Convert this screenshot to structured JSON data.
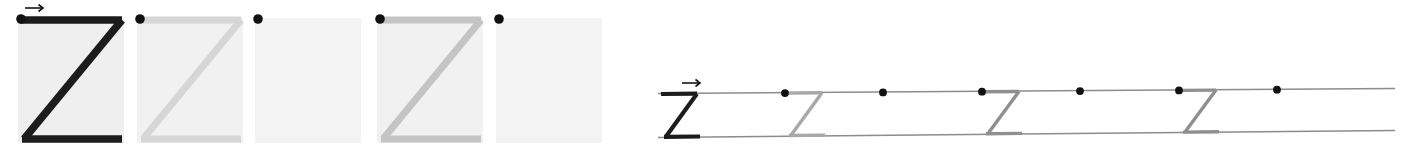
{
  "worksheet": {
    "letter": "Z",
    "title": "Letter Z handwriting practice worksheet",
    "direction_arrow": "→",
    "arrow_label": "stroke-direction-arrow",
    "colors": {
      "page_background": "#ffffff",
      "box_fill": "#efefef",
      "box_fill_light": "#f2f2f2",
      "stroke_dark": "#1c1c1c",
      "stroke_mid_gray": "#b9b9b9",
      "stroke_light_gray": "#d6d6d6",
      "start_dot": "#111111",
      "rule_line": "#8c8c8c"
    }
  },
  "practice_boxes": {
    "label": "Letter tracing boxes",
    "count": 5,
    "items": [
      {
        "index": 1,
        "name": "model-letter-box",
        "glyph": "Z",
        "stroke_shade": "dark",
        "stroke_color": "#1c1c1c",
        "has_letter": true,
        "has_start_dot": true,
        "has_direction_arrow": true,
        "caption": "Model letter shown in full black"
      },
      {
        "index": 2,
        "name": "trace-letter-box",
        "glyph": "Z",
        "stroke_shade": "light-gray",
        "stroke_color": "#d6d6d6",
        "has_letter": true,
        "has_start_dot": true,
        "has_direction_arrow": false,
        "caption": "Faint trace guide"
      },
      {
        "index": 3,
        "name": "blank-practice-box",
        "glyph": "",
        "stroke_shade": "none",
        "stroke_color": "",
        "has_letter": false,
        "has_start_dot": true,
        "has_direction_arrow": false,
        "caption": "Empty box with start dot only"
      },
      {
        "index": 4,
        "name": "trace-letter-box",
        "glyph": "Z",
        "stroke_shade": "mid-gray",
        "stroke_color": "#c4c4c4",
        "has_letter": true,
        "has_start_dot": true,
        "has_direction_arrow": false,
        "caption": "Faint trace guide"
      },
      {
        "index": 5,
        "name": "blank-practice-box",
        "glyph": "",
        "stroke_shade": "none",
        "stroke_color": "",
        "has_letter": false,
        "has_start_dot": true,
        "has_direction_arrow": false,
        "caption": "Empty box with start dot only"
      }
    ]
  },
  "writing_line": {
    "label": "Ruled writing strip",
    "has_direction_arrow": true,
    "direction_arrow": "→",
    "rules": [
      {
        "name": "top-rule-line",
        "position": "top"
      },
      {
        "name": "bottom-rule-line",
        "position": "bottom"
      }
    ],
    "start_dots": {
      "name": "start-dot",
      "count": 6
    },
    "letters": [
      {
        "index": 1,
        "glyph": "Z",
        "stroke_shade": "dark",
        "stroke_color": "#1c1c1c",
        "has_letter": true
      },
      {
        "index": 2,
        "glyph": "Z",
        "stroke_shade": "gray",
        "stroke_color": "#a8a8a8",
        "has_letter": true
      },
      {
        "index": 3,
        "glyph": "",
        "stroke_shade": "none",
        "stroke_color": "",
        "has_letter": false
      },
      {
        "index": 4,
        "glyph": "Z",
        "stroke_shade": "gray",
        "stroke_color": "#8f8f8f",
        "has_letter": true
      },
      {
        "index": 5,
        "glyph": "",
        "stroke_shade": "none",
        "stroke_color": "",
        "has_letter": false
      },
      {
        "index": 6,
        "glyph": "Z",
        "stroke_shade": "gray",
        "stroke_color": "#8f8f8f",
        "has_letter": true
      },
      {
        "index": 7,
        "glyph": "",
        "stroke_shade": "none",
        "stroke_color": "",
        "has_letter": false
      }
    ]
  }
}
